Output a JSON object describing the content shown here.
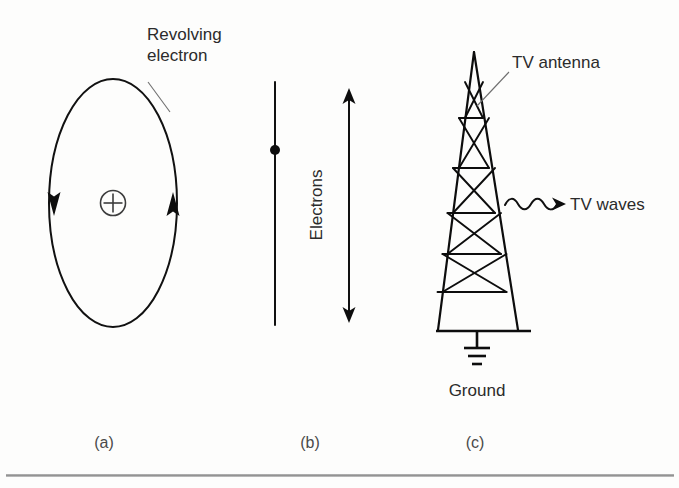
{
  "figure": {
    "background_color": "#fdfdfc",
    "ink_color": "#111111",
    "rule_color": "#8f8f8f"
  },
  "panel_a": {
    "caption": "(a)",
    "annotation_line1": "Revolving",
    "annotation_line2": "electron",
    "nucleus_symbol": "+",
    "left_arrow_direction": "down",
    "right_arrow_direction": "up"
  },
  "panel_b": {
    "caption": "(b)",
    "axis_label": "Electrons",
    "arrow_direction": "double"
  },
  "panel_c": {
    "caption": "(c)",
    "antenna_label": "TV antenna",
    "waves_label": "TV waves",
    "ground_label": "Ground"
  }
}
